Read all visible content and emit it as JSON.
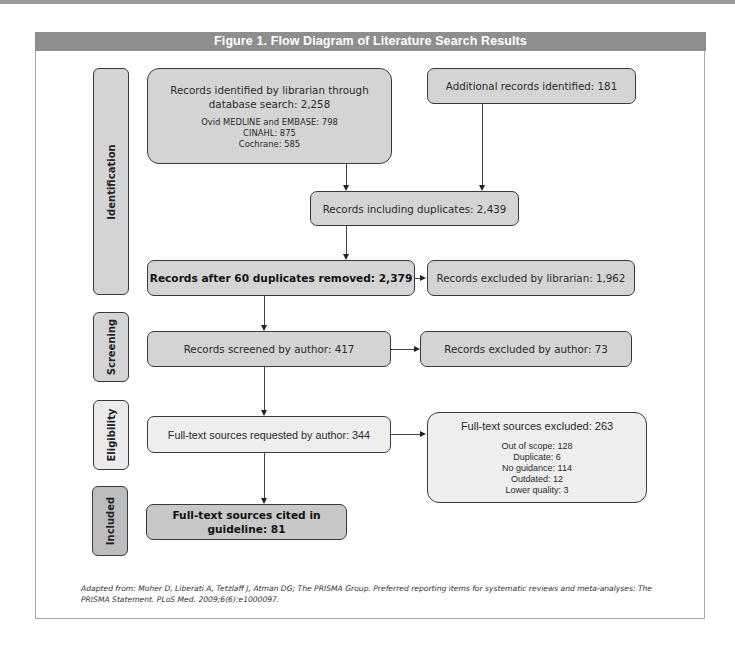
{
  "figure": {
    "title": "Figure 1.  Flow Diagram of Literature Search Results",
    "header_color": "#8e8e8e",
    "caption": "Adapted from: Moher D, Liberati A, Tetzlaff J, Atman DG; The PRISMA Group. Preferred reporting items for systematic reviews and meta-analyses: The PRISMA Statement. PLoS Med. 2009;6(6):e1000097."
  },
  "stages": {
    "identification": "Identification",
    "screening": "Screening",
    "eligibility": "Eligibility",
    "included": "Included"
  },
  "boxes": {
    "database": {
      "main": "Records identified by librarian through database search: 2,258",
      "sub": [
        "Ovid MEDLINE and EMBASE: 798",
        "CINAHL: 875",
        "Cochrane: 585"
      ]
    },
    "additional": {
      "main": "Additional records identified: 181"
    },
    "including_duplicates": {
      "main": "Records including duplicates: 2,439"
    },
    "after_duplicates": {
      "main": "Records after 60 duplicates removed: 2,379"
    },
    "excluded_librarian": {
      "main": "Records excluded by librarian: 1,962"
    },
    "screened": {
      "main": "Records screened by author: 417"
    },
    "excluded_author": {
      "main": "Records excluded by author: 73"
    },
    "requested": {
      "main": "Full-text sources requested by author: 344"
    },
    "fulltext_excluded": {
      "main": "Full-text sources excluded: 263",
      "sub": [
        "Out of scope: 128",
        "Duplicate: 6",
        "No guidance: 114",
        "Outdated: 12",
        "Lower quality: 3"
      ]
    },
    "cited": {
      "main": "Full-text sources cited in guideline: 81"
    }
  }
}
